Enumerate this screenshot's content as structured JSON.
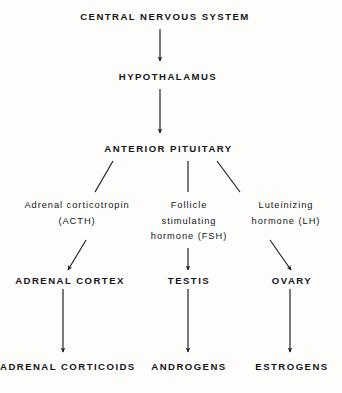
{
  "diagram": {
    "title": "CENTRAL NERVOUS SYSTEM",
    "type": "flowchart",
    "orientation": "top-to-bottom",
    "stroke_color": "#1b1b1f",
    "text_color": "#15161a",
    "background_color": "#fdfdfc",
    "levels": [
      {
        "level": 1,
        "name": "central-nervous-system",
        "nodes": [
          {
            "id": "cns",
            "label": "CENTRAL NERVOUS SYSTEM",
            "style": "caps"
          }
        ]
      },
      {
        "level": 2,
        "name": "hypothalamus",
        "nodes": [
          {
            "id": "hypothalamus",
            "label": "HYPOTHALAMUS",
            "style": "caps"
          }
        ]
      },
      {
        "level": 3,
        "name": "anterior-pituitary",
        "nodes": [
          {
            "id": "anterior-pituitary",
            "label": "ANTERIOR PITUITARY",
            "style": "caps"
          }
        ]
      },
      {
        "level": 4,
        "name": "pituitary-hormones",
        "nodes": [
          {
            "id": "acth",
            "style": "hormone",
            "lines": [
              "Adrenal corticotropin",
              "(ACTH)"
            ]
          },
          {
            "id": "fsh",
            "style": "hormone",
            "lines": [
              "Follicle",
              "stimulating",
              "hormone (FSH)"
            ]
          },
          {
            "id": "lh",
            "style": "hormone",
            "lines": [
              "Luteinizing",
              "hormone (LH)"
            ]
          }
        ]
      },
      {
        "level": 5,
        "name": "target-organs",
        "nodes": [
          {
            "id": "adrenal-cortex",
            "label": "ADRENAL CORTEX",
            "style": "caps"
          },
          {
            "id": "testis",
            "label": "TESTIS",
            "style": "caps"
          },
          {
            "id": "ovary",
            "label": "OVARY",
            "style": "caps"
          }
        ]
      },
      {
        "level": 6,
        "name": "end-hormones",
        "nodes": [
          {
            "id": "adrenal-corticoids",
            "label": "ADRENAL CORTICOIDS",
            "style": "caps"
          },
          {
            "id": "androgens",
            "label": "ANDROGENS",
            "style": "caps"
          },
          {
            "id": "estrogens",
            "label": "ESTROGENS",
            "style": "caps"
          }
        ]
      }
    ],
    "edges": [
      {
        "id": "cns-to-hypothalamus",
        "from": "cns",
        "to": "hypothalamus",
        "arrowhead": true,
        "shape": "vertical"
      },
      {
        "id": "hypothalamus-to-pituitary",
        "from": "hypothalamus",
        "to": "anterior-pituitary",
        "arrowhead": true,
        "shape": "vertical"
      },
      {
        "id": "pituitary-to-acth",
        "from": "anterior-pituitary",
        "to": "acth",
        "arrowhead": false,
        "shape": "diagonal-left"
      },
      {
        "id": "pituitary-to-fsh",
        "from": "anterior-pituitary",
        "to": "fsh",
        "arrowhead": false,
        "shape": "vertical"
      },
      {
        "id": "pituitary-to-lh",
        "from": "anterior-pituitary",
        "to": "lh",
        "arrowhead": false,
        "shape": "diagonal-right"
      },
      {
        "id": "acth-to-adrenal-cortex",
        "from": "acth",
        "to": "adrenal-cortex",
        "arrowhead": true,
        "shape": "diagonal-left"
      },
      {
        "id": "fsh-to-testis",
        "from": "fsh",
        "to": "testis",
        "arrowhead": true,
        "shape": "vertical"
      },
      {
        "id": "lh-to-ovary",
        "from": "lh",
        "to": "ovary",
        "arrowhead": true,
        "shape": "diagonal-right"
      },
      {
        "id": "adrenal-cortex-to-corticoids",
        "from": "adrenal-cortex",
        "to": "adrenal-corticoids",
        "arrowhead": true,
        "shape": "vertical"
      },
      {
        "id": "testis-to-androgens",
        "from": "testis",
        "to": "androgens",
        "arrowhead": true,
        "shape": "vertical"
      },
      {
        "id": "ovary-to-estrogens",
        "from": "ovary",
        "to": "estrogens",
        "arrowhead": true,
        "shape": "vertical"
      }
    ]
  }
}
